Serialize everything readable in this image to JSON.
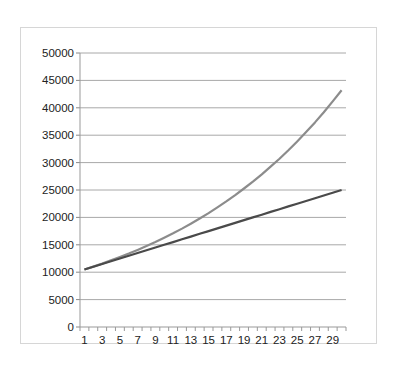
{
  "chart_data": {
    "type": "line",
    "title": "",
    "xlabel": "",
    "ylabel": "",
    "ylim": [
      0,
      50000
    ],
    "yticks": [
      0,
      5000,
      10000,
      15000,
      20000,
      25000,
      30000,
      35000,
      40000,
      45000,
      50000
    ],
    "x": [
      1,
      2,
      3,
      4,
      5,
      6,
      7,
      8,
      9,
      10,
      11,
      12,
      13,
      14,
      15,
      16,
      17,
      18,
      19,
      20,
      21,
      22,
      23,
      24,
      25,
      26,
      27,
      28,
      29,
      30
    ],
    "xtick_labels": [
      "1",
      "3",
      "5",
      "7",
      "9",
      "11",
      "13",
      "15",
      "17",
      "19",
      "21",
      "23",
      "25",
      "27",
      "29"
    ],
    "grid": true,
    "legend": "none",
    "series": [
      {
        "name": "Compound growth",
        "color": "#8c8c8c",
        "values": [
          10500,
          11025,
          11576,
          12155,
          12763,
          13401,
          14071,
          14775,
          15513,
          16289,
          17103,
          17959,
          18856,
          19799,
          20789,
          21829,
          22920,
          24066,
          25270,
          26533,
          27860,
          29253,
          30715,
          32251,
          33864,
          35557,
          37335,
          39201,
          41161,
          43219
        ]
      },
      {
        "name": "Linear growth",
        "color": "#4a4a4a",
        "values": [
          10500,
          11000,
          11500,
          12000,
          12500,
          13000,
          13500,
          14000,
          14500,
          15000,
          15500,
          16000,
          16500,
          17000,
          17500,
          18000,
          18500,
          19000,
          19500,
          20000,
          20500,
          21000,
          21500,
          22000,
          22500,
          23000,
          23500,
          24000,
          24500,
          25000
        ]
      }
    ]
  }
}
